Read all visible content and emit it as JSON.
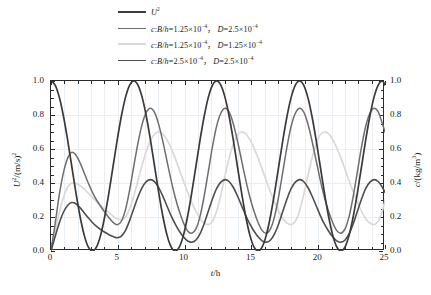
{
  "chart_data": {
    "type": "line",
    "title": "",
    "xlabel": "t/h",
    "ylabel": "U²/(m/s)²",
    "ylabel_right": "c/(kg/m³)",
    "xlim": [
      0,
      25
    ],
    "ylim": [
      0.0,
      1.0
    ],
    "ylim_right": [
      0.0,
      1.0
    ],
    "grid": true,
    "legend_position": "above-plot",
    "xticks": [
      0,
      5,
      10,
      15,
      20,
      25
    ],
    "xticklabels": [
      "0",
      "5",
      "10",
      "15",
      "20",
      "25"
    ],
    "xticks_minor_step": 1,
    "yticks": [
      0.0,
      0.2,
      0.4,
      0.6,
      0.8,
      1.0
    ],
    "yticklabels": [
      "0.0",
      "0.2",
      "0.4",
      "0.6",
      "0.8",
      "1.0"
    ],
    "yticklabels_right": [
      "0.0",
      "0.2",
      "0.4",
      "0.6",
      "0.8",
      "1.0"
    ],
    "yticks_minor_step": 0.05,
    "series": [
      {
        "name": "U²",
        "label_html": "<i>U</i><sup>2</sup>",
        "color": "#3a3a3a",
        "axis": "left",
        "width": 1.7,
        "period_h": 6.2,
        "x": [
          0.0,
          0.31,
          0.62,
          0.93,
          1.24,
          1.55,
          1.86,
          2.17,
          2.48,
          2.79,
          3.1,
          3.41,
          3.72,
          4.03,
          4.34,
          4.65,
          4.96,
          5.27,
          5.58,
          5.89,
          6.2,
          6.51,
          6.82,
          7.13,
          7.44,
          7.75,
          8.06,
          8.37,
          8.68,
          8.99,
          9.3,
          9.61,
          9.92,
          10.23,
          10.54,
          10.85,
          11.16,
          11.47,
          11.78,
          12.09,
          12.4,
          12.71,
          13.02,
          13.33,
          13.64,
          13.95,
          14.26,
          14.57,
          14.88,
          15.19,
          15.5,
          15.81,
          16.12,
          16.43,
          16.74,
          17.05,
          17.36,
          17.67,
          17.98,
          18.29,
          18.6,
          18.91,
          19.22,
          19.53,
          19.84,
          20.15,
          20.46,
          20.77,
          21.08,
          21.39,
          21.7,
          22.01,
          22.32,
          22.63,
          22.94,
          23.25,
          23.56,
          23.87,
          24.18,
          24.49,
          24.8,
          25.0
        ],
        "y": [
          1.0,
          0.976,
          0.905,
          0.794,
          0.655,
          0.5,
          0.345,
          0.206,
          0.095,
          0.024,
          0.0,
          0.024,
          0.095,
          0.206,
          0.345,
          0.5,
          0.655,
          0.794,
          0.905,
          0.976,
          1.0,
          0.976,
          0.905,
          0.794,
          0.655,
          0.5,
          0.345,
          0.206,
          0.095,
          0.024,
          0.0,
          0.024,
          0.095,
          0.206,
          0.345,
          0.5,
          0.655,
          0.794,
          0.905,
          0.976,
          1.0,
          0.976,
          0.905,
          0.794,
          0.655,
          0.5,
          0.345,
          0.206,
          0.095,
          0.024,
          0.0,
          0.024,
          0.095,
          0.206,
          0.345,
          0.5,
          0.655,
          0.794,
          0.905,
          0.976,
          1.0,
          0.976,
          0.905,
          0.794,
          0.655,
          0.5,
          0.345,
          0.206,
          0.095,
          0.024,
          0.0,
          0.024,
          0.095,
          0.206,
          0.345,
          0.5,
          0.655,
          0.794,
          0.905,
          0.976,
          1.0,
          0.976
        ]
      },
      {
        "name": "c: B/h=1.25e-4, D=2.5e-4",
        "label_html": "<i>c</i>:<i>B</i>/<i>h</i>=1.25×10<sup>−4</sup>，  <i>D</i>=2.5×10<sup>−4</sup>",
        "color": "#6e6e6e",
        "axis": "right",
        "width": 1.5,
        "peaks": [
          0.58,
          0.84,
          0.84,
          0.84,
          0.84
        ],
        "troughs": [
          0.0,
          0.155,
          0.105,
          0.105,
          0.105
        ],
        "x": [
          0.0,
          0.31,
          0.62,
          0.93,
          1.24,
          1.55,
          1.86,
          2.17,
          2.48,
          2.79,
          3.1,
          3.41,
          3.72,
          4.03,
          4.34,
          4.65,
          4.96,
          5.27,
          5.58,
          5.89,
          6.2,
          6.51,
          6.82,
          7.13,
          7.44,
          7.75,
          8.06,
          8.37,
          8.68,
          8.99,
          9.3,
          9.61,
          9.92,
          10.23,
          10.54,
          10.85,
          11.16,
          11.47,
          11.78,
          12.09,
          12.4,
          12.71,
          13.02,
          13.33,
          13.64,
          13.95,
          14.26,
          14.57,
          14.88,
          15.19,
          15.5,
          15.81,
          16.12,
          16.43,
          16.74,
          17.05,
          17.36,
          17.67,
          17.98,
          18.29,
          18.6,
          18.91,
          19.22,
          19.53,
          19.84,
          20.15,
          20.46,
          20.77,
          21.08,
          21.39,
          21.7,
          22.01,
          22.32,
          22.63,
          22.94,
          23.25,
          23.56,
          23.87,
          24.18,
          24.49,
          24.8,
          25.0
        ],
        "y": [
          0.0,
          0.16,
          0.33,
          0.46,
          0.545,
          0.58,
          0.565,
          0.52,
          0.46,
          0.4,
          0.345,
          0.3,
          0.262,
          0.228,
          0.196,
          0.168,
          0.155,
          0.175,
          0.245,
          0.36,
          0.5,
          0.635,
          0.745,
          0.815,
          0.84,
          0.815,
          0.745,
          0.645,
          0.53,
          0.415,
          0.315,
          0.232,
          0.165,
          0.118,
          0.105,
          0.13,
          0.205,
          0.325,
          0.47,
          0.615,
          0.735,
          0.81,
          0.84,
          0.818,
          0.75,
          0.65,
          0.535,
          0.42,
          0.318,
          0.235,
          0.168,
          0.12,
          0.105,
          0.13,
          0.205,
          0.325,
          0.47,
          0.615,
          0.735,
          0.81,
          0.84,
          0.818,
          0.75,
          0.65,
          0.535,
          0.42,
          0.318,
          0.235,
          0.168,
          0.12,
          0.105,
          0.13,
          0.205,
          0.325,
          0.47,
          0.615,
          0.735,
          0.81,
          0.84,
          0.818,
          0.75,
          0.7
        ]
      },
      {
        "name": "c: B/h=1.25e-4, D=1.25e-4",
        "label_html": "<i>c</i>:<i>B</i>/<i>h</i>=1.25×10<sup>−4</sup>，  <i>D</i>=1.25×10<sup>−4</sup>",
        "color": "#d9d9d9",
        "axis": "right",
        "width": 1.7,
        "peaks": [
          0.4,
          0.7,
          0.7,
          0.7,
          0.7
        ],
        "troughs": [
          0.0,
          0.185,
          0.155,
          0.155,
          0.155
        ],
        "x": [
          0.0,
          0.31,
          0.62,
          0.93,
          1.24,
          1.55,
          1.86,
          2.17,
          2.48,
          2.79,
          3.1,
          3.41,
          3.72,
          4.03,
          4.34,
          4.65,
          4.96,
          5.27,
          5.58,
          5.89,
          6.2,
          6.51,
          6.82,
          7.13,
          7.44,
          7.75,
          8.06,
          8.37,
          8.68,
          8.99,
          9.3,
          9.61,
          9.92,
          10.23,
          10.54,
          10.85,
          11.16,
          11.47,
          11.78,
          12.09,
          12.4,
          12.71,
          13.02,
          13.33,
          13.64,
          13.95,
          14.26,
          14.57,
          14.88,
          15.19,
          15.5,
          15.81,
          16.12,
          16.43,
          16.74,
          17.05,
          17.36,
          17.67,
          17.98,
          18.29,
          18.6,
          18.91,
          19.22,
          19.53,
          19.84,
          20.15,
          20.46,
          20.77,
          21.08,
          21.39,
          21.7,
          22.01,
          22.32,
          22.63,
          22.94,
          23.25,
          23.56,
          23.87,
          24.18,
          24.49,
          24.8,
          25.0
        ],
        "y": [
          0.0,
          0.115,
          0.225,
          0.315,
          0.375,
          0.4,
          0.398,
          0.385,
          0.365,
          0.34,
          0.315,
          0.29,
          0.268,
          0.245,
          0.225,
          0.205,
          0.19,
          0.185,
          0.2,
          0.25,
          0.325,
          0.415,
          0.505,
          0.585,
          0.648,
          0.688,
          0.7,
          0.688,
          0.655,
          0.605,
          0.545,
          0.478,
          0.41,
          0.345,
          0.285,
          0.232,
          0.19,
          0.165,
          0.155,
          0.175,
          0.235,
          0.33,
          0.44,
          0.545,
          0.628,
          0.683,
          0.7,
          0.69,
          0.657,
          0.607,
          0.547,
          0.48,
          0.412,
          0.347,
          0.287,
          0.233,
          0.19,
          0.165,
          0.155,
          0.175,
          0.235,
          0.33,
          0.44,
          0.545,
          0.628,
          0.683,
          0.7,
          0.69,
          0.657,
          0.607,
          0.547,
          0.48,
          0.412,
          0.347,
          0.287,
          0.233,
          0.19,
          0.165,
          0.155,
          0.175,
          0.235,
          0.3
        ]
      },
      {
        "name": "c: B/h=2.5e-4, D=2.5e-4",
        "label_html": "<i>c</i>:<i>B</i>/<i>h</i>=2.5×10<sup>−4</sup>，  <i>D</i>=2.5×10<sup>−4</sup>",
        "color": "#4e4e4e",
        "axis": "right",
        "width": 1.6,
        "peaks": [
          0.285,
          0.42,
          0.42,
          0.42,
          0.42
        ],
        "troughs": [
          0.0,
          0.078,
          0.052,
          0.052,
          0.052
        ],
        "x": [
          0.0,
          0.31,
          0.62,
          0.93,
          1.24,
          1.55,
          1.86,
          2.17,
          2.48,
          2.79,
          3.1,
          3.41,
          3.72,
          4.03,
          4.34,
          4.65,
          4.96,
          5.27,
          5.58,
          5.89,
          6.2,
          6.51,
          6.82,
          7.13,
          7.44,
          7.75,
          8.06,
          8.37,
          8.68,
          8.99,
          9.3,
          9.61,
          9.92,
          10.23,
          10.54,
          10.85,
          11.16,
          11.47,
          11.78,
          12.09,
          12.4,
          12.71,
          13.02,
          13.33,
          13.64,
          13.95,
          14.26,
          14.57,
          14.88,
          15.19,
          15.5,
          15.81,
          16.12,
          16.43,
          16.74,
          17.05,
          17.36,
          17.67,
          17.98,
          18.29,
          18.6,
          18.91,
          19.22,
          19.53,
          19.84,
          20.15,
          20.46,
          20.77,
          21.08,
          21.39,
          21.7,
          22.01,
          22.32,
          22.63,
          22.94,
          23.25,
          23.56,
          23.87,
          24.18,
          24.49,
          24.8,
          25.0
        ],
        "y": [
          0.0,
          0.085,
          0.165,
          0.228,
          0.268,
          0.285,
          0.278,
          0.255,
          0.225,
          0.195,
          0.168,
          0.145,
          0.126,
          0.11,
          0.096,
          0.085,
          0.078,
          0.088,
          0.122,
          0.18,
          0.25,
          0.318,
          0.373,
          0.408,
          0.42,
          0.408,
          0.373,
          0.323,
          0.265,
          0.208,
          0.158,
          0.116,
          0.082,
          0.059,
          0.052,
          0.065,
          0.102,
          0.162,
          0.235,
          0.307,
          0.368,
          0.405,
          0.42,
          0.409,
          0.375,
          0.325,
          0.268,
          0.21,
          0.159,
          0.118,
          0.084,
          0.06,
          0.052,
          0.065,
          0.102,
          0.162,
          0.235,
          0.307,
          0.368,
          0.405,
          0.42,
          0.409,
          0.375,
          0.325,
          0.268,
          0.21,
          0.159,
          0.118,
          0.084,
          0.06,
          0.052,
          0.065,
          0.102,
          0.162,
          0.235,
          0.307,
          0.368,
          0.405,
          0.42,
          0.409,
          0.375,
          0.345
        ]
      }
    ]
  },
  "axes": {
    "x_title_html": "<i>t</i>/h",
    "y_title_left_html": "<i>U</i><sup>2</sup>/(m/s)<sup>2</sup>",
    "y_title_right_html": "<i>c</i>/(kg/m<sup>3</sup>)"
  }
}
